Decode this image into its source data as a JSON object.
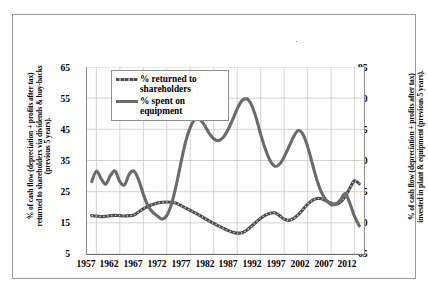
{
  "chart_data": {
    "type": "line",
    "title": "",
    "xlabel": "",
    "ylabel": "% of cash flow (depreciation + profits after tax)\nreturned to shareholders via dividends & buy-backs\n(previous 5 years).",
    "ylabel_right": "% of cash flow (depreciation + profits after tax)\ninvested in plant & equipment (previous 5 years).",
    "grid": true,
    "legend_position": "top-left-inside",
    "xlim": [
      1955,
      2014
    ],
    "xticks": [
      "1957",
      "1962",
      "1967",
      "1972",
      "1977",
      "1982",
      "1987",
      "1992",
      "1997",
      "2002",
      "2007",
      "2012"
    ],
    "ylim": [
      5,
      65
    ],
    "yticks": [
      "5",
      "15",
      "25",
      "35",
      "45",
      "55",
      "65"
    ],
    "ylim_right": [
      65,
      95
    ],
    "yticks_right": [
      "65",
      "70",
      "75",
      "80",
      "85",
      "90",
      "95"
    ],
    "series": [
      {
        "name": "% returned to shareholders",
        "axis": "left",
        "color": "#4d4d4d",
        "style": "dashed",
        "x": [
          1956,
          1957,
          1958,
          1959,
          1960,
          1961,
          1962,
          1963,
          1964,
          1965,
          1966,
          1967,
          1968,
          1969,
          1970,
          1971,
          1972,
          1973,
          1974,
          1975,
          1976,
          1977,
          1978,
          1979,
          1980,
          1981,
          1982,
          1983,
          1984,
          1985,
          1986,
          1987,
          1988,
          1989,
          1990,
          1991,
          1992,
          1993,
          1994,
          1995,
          1996,
          1997,
          1998,
          1999,
          2000,
          2001,
          2002,
          2003,
          2004,
          2005,
          2006,
          2007,
          2008,
          2009,
          2010,
          2011,
          2012,
          2013
        ],
        "values": [
          17.3,
          17.2,
          17.0,
          17.1,
          17.3,
          17.4,
          17.3,
          17.2,
          17.3,
          17.5,
          18.5,
          19.5,
          20.3,
          20.9,
          21.4,
          21.6,
          21.7,
          21.6,
          21.3,
          20.6,
          19.8,
          19.0,
          18.2,
          17.4,
          16.5,
          15.6,
          14.8,
          14.0,
          13.3,
          12.6,
          12.0,
          11.7,
          11.8,
          12.6,
          13.9,
          15.2,
          16.5,
          17.5,
          18.1,
          18.2,
          17.3,
          16.2,
          15.8,
          16.4,
          17.6,
          19.3,
          21.0,
          22.2,
          22.8,
          22.7,
          22.0,
          21.3,
          21.0,
          21.7,
          23.5,
          26.2,
          28.5,
          27.5
        ],
        "values_right_equivalent": null
      },
      {
        "name": "% spent on equipment",
        "axis": "right",
        "color": "#6b6b6b",
        "style": "solid",
        "x": [
          1956,
          1957,
          1958,
          1959,
          1960,
          1961,
          1962,
          1963,
          1964,
          1965,
          1966,
          1967,
          1968,
          1969,
          1970,
          1971,
          1972,
          1973,
          1974,
          1975,
          1976,
          1977,
          1978,
          1979,
          1980,
          1981,
          1982,
          1983,
          1984,
          1985,
          1986,
          1987,
          1988,
          1989,
          1990,
          1991,
          1992,
          1993,
          1994,
          1995,
          1996,
          1997,
          1998,
          1999,
          2000,
          2001,
          2002,
          2003,
          2004,
          2005,
          2006,
          2007,
          2008,
          2009,
          2010,
          2011,
          2012,
          2013
        ],
        "values": [
          76.6,
          78.3,
          77.1,
          76.2,
          77.6,
          78.3,
          76.6,
          76.1,
          77.8,
          78.3,
          76.9,
          74.6,
          72.7,
          71.7,
          71.1,
          70.6,
          71.2,
          73.0,
          76.0,
          79.6,
          83.0,
          85.3,
          86.6,
          86.6,
          85.7,
          84.4,
          83.5,
          83.2,
          83.7,
          84.9,
          86.5,
          88.3,
          89.6,
          89.9,
          89.0,
          86.9,
          84.2,
          81.8,
          80.0,
          79.1,
          79.4,
          80.6,
          82.2,
          83.8,
          84.8,
          84.2,
          82.2,
          79.5,
          76.8,
          74.8,
          73.6,
          72.9,
          73.0,
          73.7,
          74.7,
          73.1,
          71.0,
          69.5
        ],
        "values_left_equivalent": null
      }
    ]
  },
  "legend": {
    "items": [
      {
        "label_line1": "% returned to",
        "label_line2": "shareholders"
      },
      {
        "label_line1": "% spent on",
        "label_line2": "equipment"
      }
    ]
  }
}
